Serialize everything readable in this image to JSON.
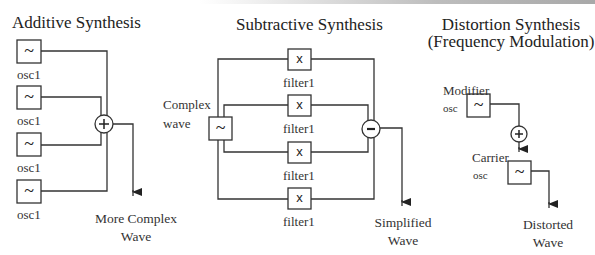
{
  "sections": {
    "additive": {
      "title": "Additive Synthesis",
      "oscillators": [
        {
          "label": "osc1",
          "symbol": "~"
        },
        {
          "label": "osc1",
          "symbol": "~"
        },
        {
          "label": "osc1",
          "symbol": "~"
        },
        {
          "label": "osc1",
          "symbol": "~"
        }
      ],
      "operator": "+",
      "output_line1": "More Complex",
      "output_line2": "Wave"
    },
    "subtractive": {
      "title": "Subtractive Synthesis",
      "source_label_line1": "Complex",
      "source_label_line2": "wave",
      "source_symbol": "~",
      "filters": [
        {
          "label": "filter1",
          "symbol": "x"
        },
        {
          "label": "filter1",
          "symbol": "x"
        },
        {
          "label": "filter1",
          "symbol": "x"
        },
        {
          "label": "filter1",
          "symbol": "x"
        }
      ],
      "operator": "-",
      "output_line1": "Simplified",
      "output_line2": "Wave"
    },
    "distortion": {
      "title_line1": "Distortion Synthesis",
      "title_line2": "(Frequency Modulation)",
      "modifier_label": "Modifier",
      "modifier_sub": "osc",
      "modifier_symbol": "~",
      "operator": "+",
      "carrier_label": "Carrier",
      "carrier_sub": "osc",
      "carrier_symbol": "~",
      "output_line1": "Distorted",
      "output_line2": "Wave"
    }
  },
  "colors": {
    "stroke": "#333333",
    "background": "#ffffff"
  }
}
